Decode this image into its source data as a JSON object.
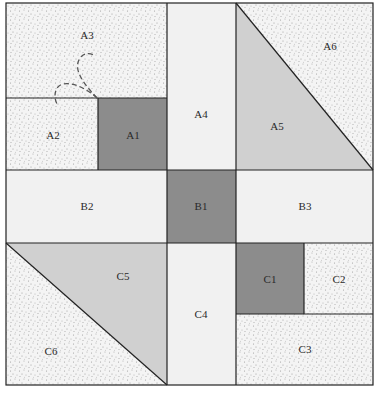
{
  "colors": {
    "dark": "#8c8c8c",
    "medium": "#d0d0d0",
    "light": "#f1f1f1",
    "stipple_bg": "#f4f4f4",
    "stipple_dot": "#9a9a9a",
    "line": "#222222",
    "dash": "#555555"
  },
  "pieces": [
    {
      "id": "A1",
      "fill": "dark"
    },
    {
      "id": "A2",
      "fill": "stipple"
    },
    {
      "id": "A3",
      "fill": "stipple"
    },
    {
      "id": "A4",
      "fill": "light"
    },
    {
      "id": "A5",
      "fill": "medium"
    },
    {
      "id": "A6",
      "fill": "stipple"
    },
    {
      "id": "B1",
      "fill": "dark"
    },
    {
      "id": "B2",
      "fill": "light"
    },
    {
      "id": "B3",
      "fill": "light"
    },
    {
      "id": "C1",
      "fill": "dark"
    },
    {
      "id": "C2",
      "fill": "stipple"
    },
    {
      "id": "C3",
      "fill": "stipple"
    },
    {
      "id": "C4",
      "fill": "light"
    },
    {
      "id": "C5",
      "fill": "medium"
    },
    {
      "id": "C6",
      "fill": "stipple"
    }
  ],
  "labels": {
    "A1": "A1",
    "A2": "A2",
    "A3": "A3",
    "A4": "A4",
    "A5": "A5",
    "A6": "A6",
    "B1": "B1",
    "B2": "B2",
    "B3": "B3",
    "C1": "C1",
    "C2": "C2",
    "C3": "C3",
    "C4": "C4",
    "C5": "C5",
    "C6": "C6"
  }
}
